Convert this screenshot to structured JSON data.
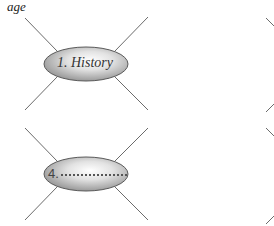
{
  "caption": "age",
  "diagrams": [
    {
      "id": 1,
      "label": "1. History",
      "is_blank": false
    },
    {
      "id": 4,
      "label": "4.",
      "is_blank": true
    }
  ],
  "colors": {
    "line": "#6b6b6b",
    "ellipse_stroke": "#5a5a5a",
    "ellipse_fill_light": "#f4f4f4",
    "ellipse_fill_dark": "#9a9a9a",
    "text": "#333333"
  }
}
